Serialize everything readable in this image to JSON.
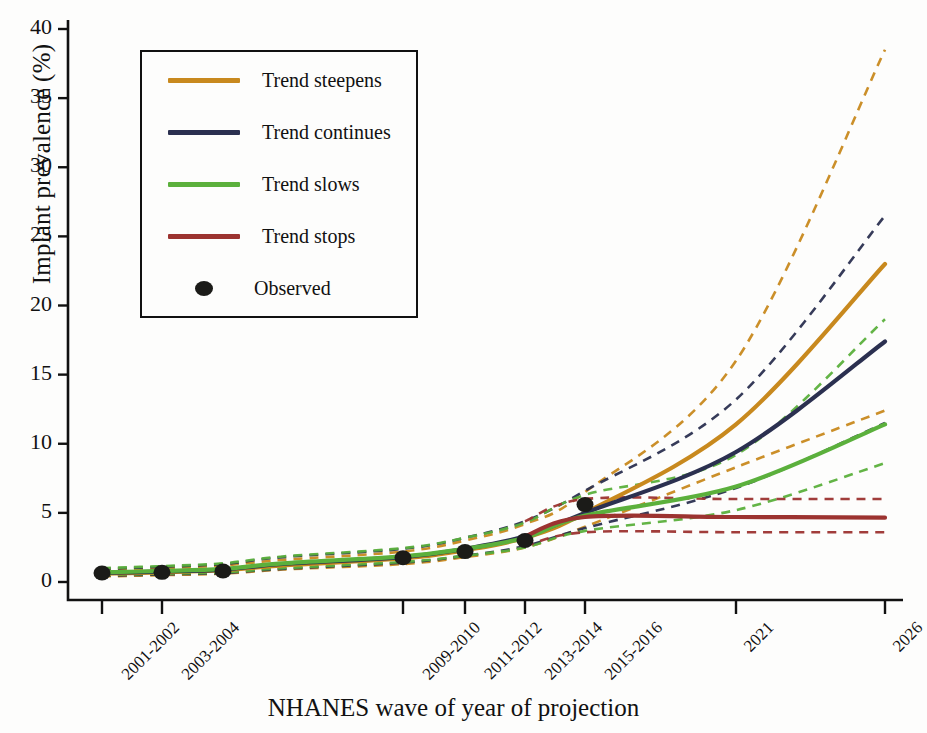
{
  "figure": {
    "ylabel": "Implant prevalence (%)",
    "xlabel": "NHANES wave of year of projection"
  },
  "legend": {
    "items": [
      {
        "label": "Trend steepens",
        "color": "#c8891e",
        "marker": "line"
      },
      {
        "label": "Trend continues",
        "color": "#2b3050",
        "marker": "line"
      },
      {
        "label": "Trend slows",
        "color": "#5bb03c",
        "marker": "line"
      },
      {
        "label": "Trend stops",
        "color": "#9c3330",
        "marker": "line"
      },
      {
        "label": "Observed",
        "color": "#1b1b18",
        "marker": "dot"
      }
    ]
  },
  "chart_data": {
    "type": "line",
    "title": "",
    "xlabel": "NHANES wave of year of projection",
    "ylabel": "Implant prevalence (%)",
    "ylim": [
      0,
      40
    ],
    "yticks": [
      0,
      5,
      10,
      15,
      20,
      25,
      30,
      35,
      40
    ],
    "grid": false,
    "legend_position": "upper-left-inset",
    "categories": [
      "2001-2002",
      "2003-2004",
      "2005-2006",
      "2007-2008",
      "2009-2010",
      "2011-2012",
      "2013-2014",
      "2015-2016",
      "2021",
      "2026"
    ],
    "x_tick_labels": [
      "2001-2002",
      "2003-2004",
      "2009-2010",
      "2011-2012",
      "2013-2014",
      "2015-2016",
      "2021",
      "2026"
    ],
    "x_tick_positions_px": [
      102,
      162,
      403,
      465,
      525,
      585,
      736,
      885
    ],
    "x_category_positions_px": [
      102,
      162,
      223,
      283,
      403,
      465,
      525,
      585,
      736,
      885
    ],
    "observed": {
      "name": "Observed",
      "marker": "filled-circle",
      "color": "#1b1b18",
      "x": [
        "2001-2002",
        "2003-2004",
        "2005-2006",
        "2009-2010",
        "2011-2012",
        "2013-2014",
        "2015-2016"
      ],
      "values": [
        0.65,
        0.7,
        0.8,
        1.75,
        2.2,
        3.0,
        5.6
      ]
    },
    "series": [
      {
        "name": "Trend steepens",
        "color": "#c8891e",
        "style": "solid",
        "x": [
          "2001-2002",
          "2003-2004",
          "2005-2006",
          "2007-2008",
          "2009-2010",
          "2011-2012",
          "2013-2014",
          "2015-2016",
          "2021",
          "2026"
        ],
        "values": [
          0.6,
          0.7,
          0.85,
          1.2,
          1.7,
          2.3,
          3.2,
          5.0,
          11.4,
          23.0
        ],
        "ci_upper": [
          0.9,
          1.0,
          1.2,
          1.6,
          2.2,
          3.0,
          4.2,
          6.5,
          16.0,
          38.5
        ],
        "ci_lower": [
          0.4,
          0.5,
          0.6,
          0.9,
          1.3,
          1.8,
          2.5,
          4.0,
          8.3,
          12.4
        ]
      },
      {
        "name": "Trend continues",
        "color": "#2b3050",
        "style": "solid",
        "x": [
          "2001-2002",
          "2003-2004",
          "2005-2006",
          "2007-2008",
          "2009-2010",
          "2011-2012",
          "2013-2014",
          "2015-2016",
          "2021",
          "2026"
        ],
        "values": [
          0.65,
          0.75,
          0.9,
          1.3,
          1.8,
          2.4,
          3.3,
          5.0,
          9.4,
          17.4
        ],
        "ci_upper": [
          0.95,
          1.1,
          1.3,
          1.8,
          2.4,
          3.2,
          4.4,
          6.6,
          13.2,
          26.5
        ],
        "ci_lower": [
          0.45,
          0.55,
          0.65,
          0.95,
          1.4,
          1.9,
          2.6,
          3.9,
          6.8,
          11.5
        ]
      },
      {
        "name": "Trend slows",
        "color": "#5bb03c",
        "style": "solid",
        "x": [
          "2001-2002",
          "2003-2004",
          "2005-2006",
          "2007-2008",
          "2009-2010",
          "2011-2012",
          "2013-2014",
          "2015-2016",
          "2021",
          "2026"
        ],
        "values": [
          0.7,
          0.8,
          0.95,
          1.35,
          1.85,
          2.4,
          3.2,
          4.8,
          6.9,
          11.4
        ],
        "ci_upper": [
          1.0,
          1.15,
          1.35,
          1.85,
          2.45,
          3.2,
          4.3,
          6.3,
          9.2,
          19.0
        ],
        "ci_lower": [
          0.5,
          0.6,
          0.7,
          1.0,
          1.45,
          1.9,
          2.5,
          3.7,
          5.2,
          8.6
        ]
      },
      {
        "name": "Trend stops",
        "color": "#9c3330",
        "style": "solid",
        "x": [
          "2013-2014",
          "2015-2016",
          "2021",
          "2026"
        ],
        "values": [
          3.3,
          4.7,
          4.7,
          4.65
        ],
        "ci_upper": [
          4.4,
          6.0,
          6.0,
          6.0
        ],
        "ci_lower": [
          2.6,
          3.6,
          3.6,
          3.6
        ]
      }
    ]
  }
}
